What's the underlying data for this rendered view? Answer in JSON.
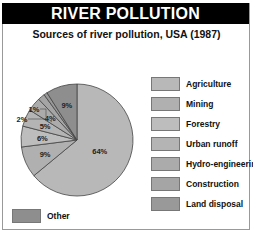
{
  "header": {
    "title": "RIVER POLLUTION"
  },
  "subtitle": "Sources of river pollution, USA (1987)",
  "chart_data": {
    "type": "pie",
    "title": "RIVER POLLUTION",
    "subtitle": "Sources of river pollution, USA (1987)",
    "categories": [
      "Agriculture",
      "Mining",
      "Forestry",
      "Urban runoff",
      "Hydro-engineering",
      "Construction",
      "Land disposal",
      "Other"
    ],
    "values": [
      64,
      9,
      6,
      5,
      4,
      2,
      1,
      9
    ],
    "labels": [
      "64%",
      "9%",
      "6%",
      "5%",
      "4%",
      "2%",
      "1%",
      "9%"
    ],
    "colors": [
      "#b8b8b8",
      "#b0b0b0",
      "#bdbdbd",
      "#b4b4b4",
      "#ababab",
      "#a5a5a5",
      "#999999",
      "#8e8e8e"
    ],
    "legend_position": "right"
  },
  "legend": {
    "items": [
      {
        "label": "Agriculture",
        "color": "#b8b8b8"
      },
      {
        "label": "Mining",
        "color": "#b0b0b0"
      },
      {
        "label": "Forestry",
        "color": "#bdbdbd"
      },
      {
        "label": "Urban runoff",
        "color": "#b4b4b4"
      },
      {
        "label": "Hydro-engineering",
        "color": "#ababab"
      },
      {
        "label": "Construction",
        "color": "#a5a5a5"
      },
      {
        "label": "Land disposal",
        "color": "#999999"
      }
    ],
    "other": {
      "label": "Other",
      "color": "#8e8e8e"
    }
  }
}
